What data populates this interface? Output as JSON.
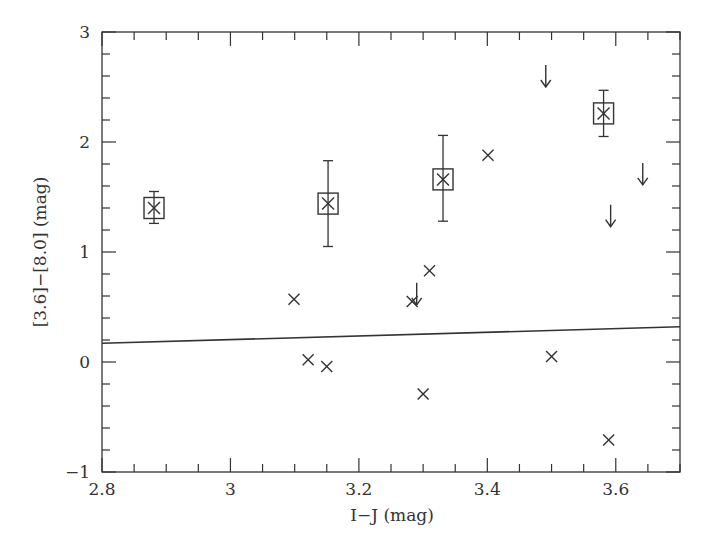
{
  "chart_data": {
    "type": "scatter",
    "title": "",
    "xlabel": "I−J  (mag)",
    "ylabel": "[3.6]−[8.0]  (mag)",
    "xlim": [
      2.8,
      3.7
    ],
    "ylim": [
      -1,
      3
    ],
    "x_ticks": [
      2.8,
      3,
      3.2,
      3.4,
      3.6
    ],
    "x_tick_labels": [
      "2.8",
      "3",
      "3.2",
      "3.4",
      "3.6"
    ],
    "y_ticks": [
      -1,
      0,
      1,
      2,
      3
    ],
    "y_tick_labels": [
      "−1",
      "0",
      "1",
      "2",
      "3"
    ],
    "x_minor_step": 0.05,
    "y_minor_step": 0.2,
    "grid": false,
    "legend": null,
    "series": [
      {
        "name": "boxed points with error bars",
        "marker": "cross-in-square",
        "points": [
          {
            "x": 2.881,
            "y": 1.4,
            "y_err_low": 1.26,
            "y_err_high": 1.55
          },
          {
            "x": 3.152,
            "y": 1.44,
            "y_err_low": 1.05,
            "y_err_high": 1.83
          },
          {
            "x": 3.331,
            "y": 1.66,
            "y_err_low": 1.28,
            "y_err_high": 2.06
          },
          {
            "x": 3.581,
            "y": 2.26,
            "y_err_low": 2.05,
            "y_err_high": 2.47
          }
        ]
      },
      {
        "name": "detections",
        "marker": "cross",
        "points": [
          {
            "x": 3.099,
            "y": 0.57
          },
          {
            "x": 3.121,
            "y": 0.02
          },
          {
            "x": 3.15,
            "y": -0.04
          },
          {
            "x": 3.283,
            "y": 0.55
          },
          {
            "x": 3.3,
            "y": -0.29
          },
          {
            "x": 3.31,
            "y": 0.83
          },
          {
            "x": 3.401,
            "y": 1.88
          },
          {
            "x": 3.5,
            "y": 0.05
          },
          {
            "x": 3.589,
            "y": -0.71
          }
        ]
      },
      {
        "name": "upper limits",
        "marker": "down-arrow",
        "points": [
          {
            "x": 3.29,
            "y": 0.72
          },
          {
            "x": 3.491,
            "y": 2.7
          },
          {
            "x": 3.592,
            "y": 1.43
          },
          {
            "x": 3.642,
            "y": 1.81
          }
        ]
      }
    ],
    "lines": [
      {
        "name": "reference line",
        "x": [
          2.8,
          3.7
        ],
        "y": [
          0.17,
          0.32
        ]
      }
    ]
  }
}
